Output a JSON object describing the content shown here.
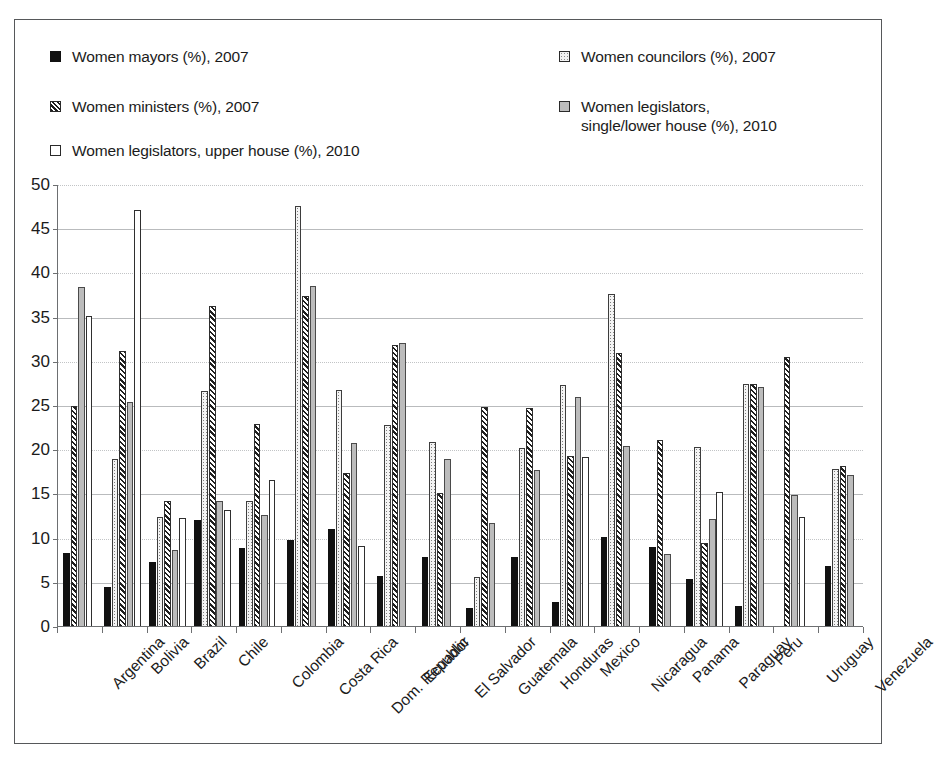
{
  "legend": {
    "items": [
      {
        "label": "Women mayors (%), 2007",
        "swatch": "solid-black-square-icon",
        "style": "sw-solid"
      },
      {
        "label": "Women ministers (%), 2007",
        "swatch": "diagonal-hatch-square-icon",
        "style": "sw-hatch"
      },
      {
        "label": "Women legislators, upper house (%), 2010",
        "swatch": "white-square-icon",
        "style": "sw-white"
      },
      {
        "label": "Women councilors (%), 2007",
        "swatch": "dotted-square-icon",
        "style": "sw-dot"
      },
      {
        "label": "Women legislators,\nsingle/lower house (%), 2010",
        "swatch": "gray-square-icon",
        "style": "sw-gray"
      }
    ]
  },
  "axis": {
    "y_ticks": [
      "0",
      "5",
      "10",
      "15",
      "20",
      "25",
      "30",
      "35",
      "40",
      "45",
      "50"
    ]
  },
  "colors": {
    "mayors": "#111111",
    "councilors": "#f4f4f4",
    "ministers": "#ffffff",
    "legislators_lower": "#bcbcbc",
    "legislators_upper": "#ffffff",
    "gridline": "#b9bbbd",
    "axis": "#6d6f71",
    "frame": "#56585a"
  },
  "chart_data": {
    "type": "bar",
    "title": "",
    "subtitle": "",
    "xlabel": "",
    "ylabel": "",
    "ylim": [
      0,
      50
    ],
    "ytick_step": 5,
    "grid": true,
    "legend_position": "top",
    "categories": [
      "Argentina",
      "Bolivia",
      "Brazil",
      "Chile",
      "Colombia",
      "Costa Rica",
      "Dom. Republic",
      "Ecuador",
      "El Salvador",
      "Guatemala",
      "Honduras",
      "Mexico",
      "Nicaragua",
      "Panama",
      "Paraguay",
      "Peru",
      "Uruguay",
      "Venezuela"
    ],
    "series": [
      {
        "name": "Women mayors (%), 2007",
        "key": "mayors",
        "values": [
          8.4,
          4.5,
          7.4,
          12.1,
          8.9,
          9.8,
          11.1,
          5.8,
          7.9,
          2.2,
          7.9,
          2.8,
          10.2,
          9.0,
          5.4,
          2.4,
          null,
          6.9
        ]
      },
      {
        "name": "Women councilors (%), 2007",
        "key": "councilors",
        "values": [
          null,
          19.0,
          12.5,
          26.7,
          14.3,
          47.6,
          26.8,
          22.8,
          20.9,
          5.7,
          20.3,
          27.4,
          37.7,
          null,
          20.4,
          27.5,
          null,
          17.9
        ]
      },
      {
        "name": "Women ministers (%), 2007",
        "key": "ministers",
        "values": [
          25.0,
          31.2,
          14.2,
          36.3,
          23.0,
          37.4,
          17.4,
          31.9,
          15.2,
          24.9,
          24.8,
          19.4,
          31.0,
          21.2,
          9.5,
          27.5,
          30.5,
          18.2
        ]
      },
      {
        "name": "Women legislators, single/lower house (%), 2010",
        "key": "legislators_lower",
        "values": [
          38.5,
          25.4,
          8.7,
          14.2,
          12.7,
          38.6,
          20.8,
          32.1,
          19.0,
          11.8,
          17.8,
          26.0,
          20.5,
          8.3,
          12.2,
          27.1,
          14.9,
          17.2
        ]
      },
      {
        "name": "Women legislators, upper house (%), 2010",
        "key": "legislators_upper",
        "values": [
          35.2,
          47.2,
          12.3,
          13.2,
          16.6,
          null,
          9.2,
          null,
          null,
          null,
          null,
          19.2,
          null,
          null,
          15.3,
          null,
          12.5,
          null
        ]
      }
    ]
  }
}
